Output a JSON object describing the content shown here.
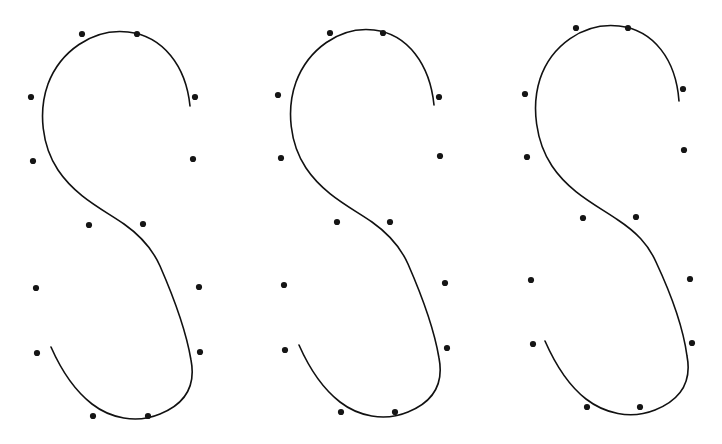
{
  "figure": {
    "background_color": "#ffffff",
    "width": 722,
    "height": 444,
    "curve_color": "#111111",
    "dot_color": "#151515",
    "curve_stroke_width": 1.6,
    "panel_count": 3
  },
  "chart_data": {
    "type": "scatter",
    "subtitle": "",
    "xlabel": "",
    "ylabel": "",
    "xlim": [
      0,
      722
    ],
    "ylim": [
      444,
      0
    ],
    "grid": false,
    "legend": null,
    "axes_visible": false,
    "tick_labels_x": [],
    "tick_labels_y": [],
    "annotations": [],
    "series": [
      {
        "name": "curve-1",
        "kind": "spline",
        "dot_radius": 3.1,
        "points": [
          {
            "x": 82,
            "y": 34
          },
          {
            "x": 137,
            "y": 34
          },
          {
            "x": 195,
            "y": 97
          },
          {
            "x": 31,
            "y": 97
          },
          {
            "x": 33,
            "y": 161
          },
          {
            "x": 193,
            "y": 159
          },
          {
            "x": 89,
            "y": 225
          },
          {
            "x": 143,
            "y": 224
          },
          {
            "x": 36,
            "y": 288
          },
          {
            "x": 199,
            "y": 287
          },
          {
            "x": 37,
            "y": 353
          },
          {
            "x": 200,
            "y": 352
          },
          {
            "x": 93,
            "y": 416
          },
          {
            "x": 148,
            "y": 416
          }
        ],
        "curve_path": "M 190 106 C 186 66, 163 36, 128 32 C 92 28, 60 52, 48 84 C 38 112, 42 146, 58 170 C 76 197, 104 210, 124 224 C 141 236, 152 248, 160 266 C 174 298, 186 330, 191 360 C 196 386, 185 404, 160 414 C 136 424, 110 418, 92 404 C 74 390, 62 372, 51 347"
      },
      {
        "name": "curve-2",
        "kind": "spline",
        "dot_radius": 3.1,
        "points": [
          {
            "x": 330,
            "y": 33
          },
          {
            "x": 383,
            "y": 33
          },
          {
            "x": 439,
            "y": 97
          },
          {
            "x": 278,
            "y": 95
          },
          {
            "x": 281,
            "y": 158
          },
          {
            "x": 440,
            "y": 156
          },
          {
            "x": 337,
            "y": 222
          },
          {
            "x": 390,
            "y": 222
          },
          {
            "x": 284,
            "y": 285
          },
          {
            "x": 445,
            "y": 283
          },
          {
            "x": 285,
            "y": 350
          },
          {
            "x": 447,
            "y": 348
          },
          {
            "x": 341,
            "y": 412
          },
          {
            "x": 395,
            "y": 412
          }
        ],
        "curve_path": "M 434 105 C 430 65, 408 34, 374 30 C 339 26, 308 50, 296 82 C 286 110, 290 144, 306 168 C 324 195, 352 208, 372 222 C 389 234, 400 246, 408 264 C 422 296, 434 328, 439 358 C 444 384, 433 402, 408 412 C 384 422, 358 416, 340 402 C 322 388, 310 370, 299 345"
      },
      {
        "name": "curve-3",
        "kind": "spline",
        "dot_radius": 3.1,
        "points": [
          {
            "x": 576,
            "y": 28
          },
          {
            "x": 628,
            "y": 28
          },
          {
            "x": 683,
            "y": 89
          },
          {
            "x": 525,
            "y": 94
          },
          {
            "x": 527,
            "y": 157
          },
          {
            "x": 684,
            "y": 150
          },
          {
            "x": 583,
            "y": 218
          },
          {
            "x": 636,
            "y": 217
          },
          {
            "x": 531,
            "y": 280
          },
          {
            "x": 690,
            "y": 279
          },
          {
            "x": 533,
            "y": 344
          },
          {
            "x": 692,
            "y": 343
          },
          {
            "x": 587,
            "y": 407
          },
          {
            "x": 640,
            "y": 407
          }
        ],
        "curve_path": "M 679 101 C 676 60, 654 30, 619 26 C 583 22, 551 46, 540 79 C 531 107, 536 142, 552 166 C 570 193, 598 206, 618 220 C 636 232, 648 244, 656 262 C 671 294, 683 326, 687 356 C 692 382, 680 400, 655 410 C 630 420, 604 413, 586 399 C 568 385, 556 366, 545 341"
      }
    ]
  }
}
